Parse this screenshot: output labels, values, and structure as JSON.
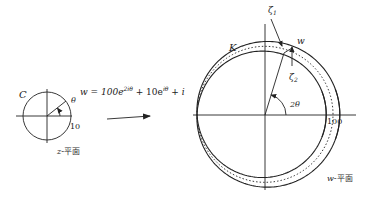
{
  "z_plane": {
    "curve_label": "C",
    "angle_label": "θ",
    "radius_label": "10",
    "plane_label_var": "z",
    "plane_label_suffix": "-平面",
    "center": [
      47,
      116
    ],
    "radius_px": 24
  },
  "mapping": {
    "lhs": "w = 100e",
    "exp1": "2iθ",
    "mid": " + 10e",
    "exp2": "iθ",
    "rhs": " + i"
  },
  "w_plane": {
    "curve_label": "K",
    "point_label": "w",
    "zeta1_label": "ζ",
    "zeta1_sub": "1",
    "zeta2_label": "ζ",
    "zeta2_sub": "2",
    "angle_label": "2θ",
    "radius_label": "100",
    "plane_label_var": "w",
    "plane_label_suffix": "-平面",
    "center": [
      265,
      115
    ],
    "scale_px_per_unit": 0.68
  },
  "colors": {
    "stroke": "#222222",
    "background": "#ffffff"
  }
}
